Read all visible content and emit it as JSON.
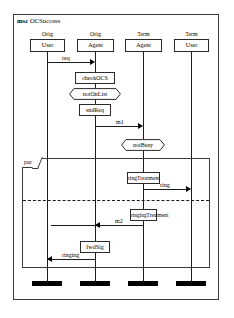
{
  "diagram": {
    "keyword": "msc",
    "name": "OCSuccess",
    "title_full": "msc OCSuccess"
  },
  "lifelines": [
    {
      "id": "orig-user",
      "qualifier": "Orig",
      "role": "User",
      "x": 47,
      "qx": 47,
      "bx": 30,
      "bw": 35
    },
    {
      "id": "orig-agent",
      "qualifier": "Orig",
      "role": "Agent",
      "x": 95,
      "qx": 95,
      "bx": 77,
      "bw": 37
    },
    {
      "id": "term-agent",
      "qualifier": "Term",
      "role": "Agent",
      "x": 143,
      "qx": 143,
      "bx": 125,
      "bw": 37
    },
    {
      "id": "term-user",
      "qualifier": "Term",
      "role": "User",
      "x": 191,
      "qx": 191,
      "bx": 174,
      "bw": 35
    }
  ],
  "actions": [
    {
      "id": "check-ocs",
      "label": "checkOCS",
      "lifeline": "orig-agent",
      "x": 75,
      "y": 72,
      "w": 40
    },
    {
      "id": "snd-req",
      "label": "sndReq",
      "lifeline": "orig-agent",
      "x": 79,
      "y": 104,
      "w": 32
    },
    {
      "id": "ring-treatment",
      "label": "ringTreatment",
      "lifeline": "term-agent",
      "x": 127,
      "y": 172,
      "w": 33
    },
    {
      "id": "ringing-treatment",
      "label": "ringingTreatment",
      "lifeline": "term-agent",
      "x": 130,
      "y": 209,
      "w": 27
    },
    {
      "id": "fwd-sig",
      "label": "fwdSig",
      "lifeline": "orig-agent",
      "x": 80,
      "y": 241,
      "w": 30
    }
  ],
  "conditions": [
    {
      "id": "not-on-list",
      "label": "notOnList",
      "lifeline": "orig-agent",
      "x": 69,
      "y": 88,
      "w": 52
    },
    {
      "id": "not-busy",
      "label": "notBusy",
      "lifeline": "term-agent",
      "x": 121,
      "y": 139,
      "w": 44
    }
  ],
  "messages": [
    {
      "id": "req",
      "label": "req",
      "from": "orig-user",
      "to": "orig-agent",
      "dir": "right",
      "y": 62,
      "x1": 47,
      "x2": 95,
      "lx": 62,
      "ly": 55
    },
    {
      "id": "m1",
      "label": "m1",
      "from": "orig-agent",
      "to": "term-agent",
      "dir": "right",
      "y": 126,
      "x1": 95,
      "x2": 143,
      "lx": 116,
      "ly": 119
    },
    {
      "id": "ring",
      "label": "ring",
      "from": "term-agent",
      "to": "term-user",
      "dir": "right",
      "y": 189,
      "x1": 143,
      "x2": 191,
      "lx": 160,
      "ly": 182
    },
    {
      "id": "m2",
      "label": "m2",
      "from": "term-agent",
      "to": "orig-agent",
      "dir": "left",
      "y": 225,
      "x1": 95,
      "x2": 143,
      "lx": 115,
      "ly": 218
    },
    {
      "id": "ringing",
      "label": "ringing",
      "from": "orig-agent",
      "to": "orig-user",
      "dir": "left",
      "y": 259,
      "x1": 47,
      "x2": 95,
      "lx": 62,
      "ly": 252
    }
  ],
  "fragment": {
    "id": "par-fragment",
    "operator": "par",
    "x": 22,
    "y": 158,
    "w": 188,
    "h": 110,
    "separator_y": 200
  },
  "terminators": [
    {
      "lifeline": "orig-user",
      "x": 32,
      "w": 30
    },
    {
      "lifeline": "orig-agent",
      "x": 80,
      "w": 30
    },
    {
      "lifeline": "term-agent",
      "x": 128,
      "w": 30
    },
    {
      "lifeline": "term-user",
      "x": 176,
      "w": 30
    }
  ],
  "colors": {
    "frame": "#3a3a3a",
    "line": "#1d1d1d",
    "terminator": "#000000",
    "background": "#ffffff"
  }
}
